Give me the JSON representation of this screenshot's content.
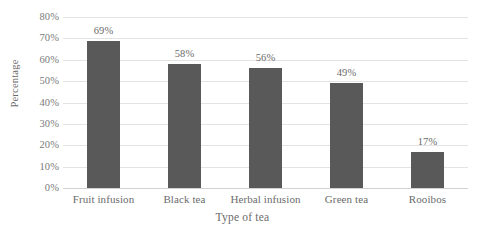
{
  "chart_data": {
    "type": "bar",
    "title": "",
    "categories": [
      "Fruit infusion",
      "Black tea",
      "Herbal infusion",
      "Green tea",
      "Rooibos"
    ],
    "values": [
      69,
      58,
      56,
      49,
      17
    ],
    "data_labels": [
      "69%",
      "58%",
      "56%",
      "49%",
      "17%"
    ],
    "xlabel": "Type of tea",
    "ylabel": "Percentage",
    "ylim": [
      0,
      80
    ],
    "ytick_values": [
      80,
      70,
      60,
      50,
      40,
      30,
      20,
      10,
      0
    ],
    "ytick_labels": [
      "80%",
      "70%",
      "60%",
      "50%",
      "40%",
      "30%",
      "20%",
      "10%",
      "0%"
    ],
    "grid": true,
    "legend": false,
    "series": [
      {
        "name": "Percentage",
        "values": [
          69,
          58,
          56,
          49,
          17
        ],
        "color": "#595959"
      }
    ],
    "colors": {
      "bar": "#595959",
      "gridline": "#e3e3e3",
      "axis": "#d2d2d2",
      "text": "#6b6b6b",
      "background": "#ffffff"
    }
  }
}
